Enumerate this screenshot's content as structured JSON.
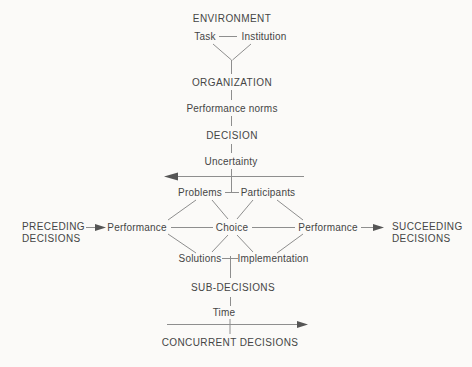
{
  "colors": {
    "background": "#fbfaf8",
    "text": "#454545",
    "line": "#8e8e8e",
    "arrow": "#555555"
  },
  "labels": {
    "environment": "ENVIRONMENT",
    "task": "Task",
    "institution": "Institution",
    "organization": "ORGANIZATION",
    "performance_norms": "Performance norms",
    "decision": "DECISION",
    "uncertainty": "Uncertainty",
    "problems": "Problems",
    "participants": "Participants",
    "preceding_line1": "PRECEDING",
    "preceding_line2": "DECISIONS",
    "performance_left": "Performance",
    "choice": "Choice",
    "performance_right": "Performance",
    "succeeding_line1": "SUCCEEDING",
    "succeeding_line2": "DECISIONS",
    "solutions": "Solutions",
    "implementation": "Implementation",
    "sub_decisions": "SUB-DECISIONS",
    "time": "Time",
    "concurrent_decisions": "CONCURRENT DECISIONS"
  },
  "edges": [
    {
      "from": "Task",
      "to": "Institution",
      "type": "line"
    },
    {
      "from": "Task",
      "to": "ORGANIZATION",
      "type": "line"
    },
    {
      "from": "Institution",
      "to": "ORGANIZATION",
      "type": "line"
    },
    {
      "from": "ORGANIZATION",
      "to": "Performance norms",
      "type": "line"
    },
    {
      "from": "Performance norms",
      "to": "DECISION",
      "type": "line"
    },
    {
      "from": "DECISION",
      "to": "Uncertainty",
      "type": "line"
    },
    {
      "from": "Uncertainty",
      "to": "Problems/Participants",
      "type": "line"
    },
    {
      "from": "Problems",
      "to": "Participants",
      "type": "line"
    },
    {
      "from": "Problems",
      "to": "Performance (left)",
      "type": "line"
    },
    {
      "from": "Problems",
      "to": "Choice",
      "type": "line"
    },
    {
      "from": "Participants",
      "to": "Choice",
      "type": "line"
    },
    {
      "from": "Participants",
      "to": "Performance (right)",
      "type": "line"
    },
    {
      "from": "Performance (left)",
      "to": "Choice",
      "type": "line"
    },
    {
      "from": "Choice",
      "to": "Performance (right)",
      "type": "line"
    },
    {
      "from": "Performance (left)",
      "to": "Solutions",
      "type": "line"
    },
    {
      "from": "Choice",
      "to": "Solutions",
      "type": "line"
    },
    {
      "from": "Choice",
      "to": "Implementation",
      "type": "line"
    },
    {
      "from": "Performance (right)",
      "to": "Implementation",
      "type": "line"
    },
    {
      "from": "Solutions",
      "to": "Implementation",
      "type": "line"
    },
    {
      "from": "Solutions/Implementation",
      "to": "SUB-DECISIONS",
      "type": "line"
    },
    {
      "from": "SUB-DECISIONS",
      "to": "Time",
      "type": "line"
    },
    {
      "from": "PRECEDING DECISIONS",
      "to": "Performance (left)",
      "type": "arrow-right"
    },
    {
      "from": "Performance (right)",
      "to": "SUCCEEDING DECISIONS",
      "type": "arrow-right"
    },
    {
      "desc": "long horizontal arrow below Uncertainty",
      "type": "arrow-left"
    },
    {
      "desc": "time axis arrow above CONCURRENT DECISIONS",
      "type": "arrow-right"
    }
  ]
}
